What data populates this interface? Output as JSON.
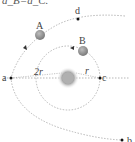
{
  "caption_fragment": "a_B=a_C.",
  "labels": {
    "point_a": "a",
    "point_b": "b",
    "point_c": "c",
    "point_d": "d",
    "planet_A": "A",
    "planet_B": "B",
    "distance_2r": "2r",
    "distance_r": "r"
  },
  "colors": {
    "orbit": "#9a9a9a",
    "point": "#111111",
    "planet": "#8c8c8c",
    "sun": "#b8b8b8"
  }
}
